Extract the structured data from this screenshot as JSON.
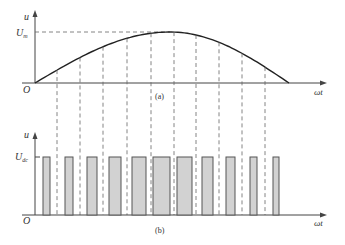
{
  "diagram": {
    "panel_a": {
      "caption": "(a)",
      "y_label": "u",
      "x_label": "ωt",
      "origin_label": "O",
      "level_label_main": "U",
      "level_label_sub": "m",
      "description": "Sinusoidal half-wave voltage reaching peak Um"
    },
    "panel_b": {
      "caption": "(b)",
      "y_label": "u",
      "x_label": "ωt",
      "origin_label": "O",
      "level_label_main": "U",
      "level_label_sub": "dc",
      "description": "PWM pulse train with amplitude Udc, pulse widths proportional to sine amplitude"
    },
    "sampling_lines_x": [
      57,
      80,
      103,
      127,
      151,
      174,
      196,
      219,
      242,
      265
    ],
    "pulses": [
      {
        "x1": 43,
        "x2": 50
      },
      {
        "x1": 65,
        "x2": 73
      },
      {
        "x1": 87,
        "x2": 97
      },
      {
        "x1": 109,
        "x2": 121
      },
      {
        "x1": 132,
        "x2": 146
      },
      {
        "x1": 153,
        "x2": 170
      },
      {
        "x1": 177,
        "x2": 192
      },
      {
        "x1": 202,
        "x2": 213
      },
      {
        "x1": 226,
        "x2": 235
      },
      {
        "x1": 250,
        "x2": 257
      },
      {
        "x1": 273,
        "x2": 279
      }
    ],
    "colors": {
      "pulse_fill": "#d2d2d2",
      "pulse_stroke": "#555555",
      "curve": "#222222",
      "dash": "#666666"
    }
  }
}
